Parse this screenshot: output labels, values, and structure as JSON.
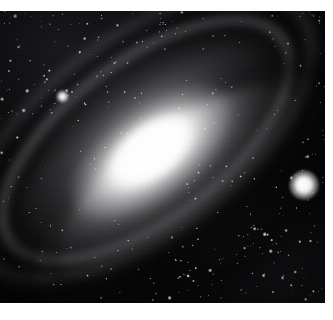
{
  "image": {
    "subject": "spiral-galaxy",
    "description": "Grayscale astronomical photographic plate of a tilted spiral galaxy",
    "orientation_deg": -37,
    "width": 333,
    "height": 320
  },
  "plate": {
    "left": 0,
    "top": 11,
    "width": 325,
    "height": 292,
    "sky_color": "#050507",
    "paper_color": "#ffffff"
  },
  "borders": {
    "top_margin": 11,
    "bottom_margin": 17,
    "right_margin": 8,
    "left_margin": 0
  },
  "galaxy": {
    "core_color": "#ffffff",
    "halo_color": "#afafb2",
    "dust_lane_color": "#040406",
    "center_x": 150,
    "center_y": 169,
    "major_axis_deg": -37,
    "components": [
      {
        "name": "outer-halo",
        "width": 430,
        "height": 225,
        "opacity": 0.6
      },
      {
        "name": "mid-halo",
        "width": 320,
        "height": 162,
        "opacity": 0.85
      },
      {
        "name": "bulge",
        "width": 196,
        "height": 96,
        "opacity": 1.0
      },
      {
        "name": "core",
        "width": 104,
        "height": 56,
        "opacity": 1.0
      },
      {
        "name": "nucleus",
        "width": 52,
        "height": 30,
        "opacity": 1.0
      }
    ],
    "dust_lanes": [
      {
        "name": "lane-a",
        "offset_x": 6,
        "offset_y": 30
      },
      {
        "name": "lane-b",
        "offset_x": 10,
        "offset_y": 22
      },
      {
        "name": "lane-c",
        "offset_x": 2,
        "offset_y": 34
      }
    ],
    "spiral_arms": [
      {
        "name": "arm-1",
        "offset_x": -26,
        "offset_y": -26
      },
      {
        "name": "arm-2",
        "offset_x": -30,
        "offset_y": -30
      },
      {
        "name": "arm-dark",
        "offset_x": -28,
        "offset_y": -28
      }
    ]
  },
  "bright_objects": [
    {
      "name": "companion-star",
      "x": 304,
      "y": 185,
      "size": 30,
      "brightness": "very-high"
    },
    {
      "name": "foreground-star-upper-left",
      "x": 62,
      "y": 96,
      "size": 13,
      "brightness": "high"
    }
  ],
  "star_field": {
    "count_visible": 140,
    "color": "#ffffff",
    "note": "scattered point sources across dark sky and galaxy disk"
  },
  "overlay": {
    "vignette": true,
    "grain": true
  }
}
